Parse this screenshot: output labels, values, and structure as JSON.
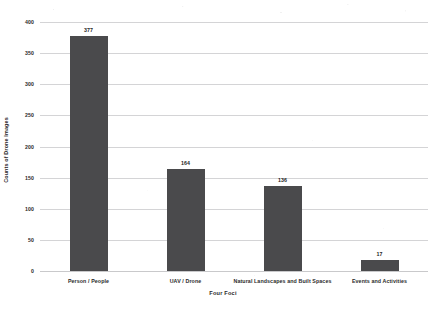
{
  "chart_data": {
    "type": "bar",
    "title": "",
    "xlabel": "Four Foci",
    "ylabel": "Counts of Drone Images",
    "categories": [
      "Person / People",
      "UAV / Drone",
      "Natural Landscapes and Built Spaces",
      "Events and Activities"
    ],
    "values": [
      377,
      164,
      136,
      17
    ],
    "value_labels": [
      "377",
      "164",
      "136",
      "17"
    ],
    "ylim": [
      0,
      400
    ],
    "ytick_labels": [
      "400",
      "350",
      "300",
      "250",
      "200",
      "150",
      "100",
      "50",
      "0"
    ],
    "ytick_values": [
      400,
      350,
      300,
      250,
      200,
      150,
      100,
      50,
      0
    ],
    "grid": true,
    "legend": false,
    "bar_color": "#4a4a4c",
    "gridline_color": "#d4d4d6",
    "background_color": "#ffffff"
  }
}
